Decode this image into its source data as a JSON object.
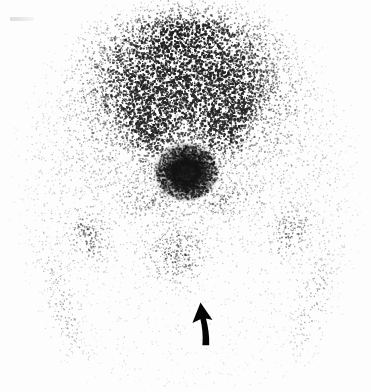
{
  "image": {
    "kind": "nuclear-medicine-scintigram",
    "modality_label": "Bone scintigraphy",
    "view_label": "Anterior pelvis",
    "width": 371,
    "height": 392,
    "background_color": "#fdfdfd",
    "noise_color": "#1a1a1a",
    "caption": ""
  },
  "annotations": {
    "arrow": {
      "name": "annotation-arrow",
      "label": "",
      "direction": "up",
      "color": "#050505",
      "tip_x": 201,
      "tip_y": 303,
      "tail_x": 208,
      "tail_y": 345
    },
    "corner_mark": {
      "name": "faint-corner-mark",
      "label": "",
      "x": 10,
      "y": 17
    }
  },
  "scan_data": {
    "type": "heatmap",
    "title": "",
    "xlabel": "",
    "ylabel": "",
    "colormap": "grayscale-inverted",
    "intensity_range": [
      0,
      1
    ],
    "grain": {
      "dots": 52000,
      "dot_size_min": 0.6,
      "dot_size_max": 1.9,
      "seed": 20240517
    },
    "field_of_view": {
      "shape": "rounded-rect",
      "cx": 186,
      "cy": 196,
      "rx": 172,
      "ry": 196
    },
    "regions": [
      {
        "name": "lumbosacral-spine-band",
        "label": "Lower lumbar spine / sacral base",
        "shape": "ellipse",
        "cx": 186,
        "cy": 30,
        "rx": 72,
        "ry": 42,
        "intensity": 0.92
      },
      {
        "name": "upper-sacrum",
        "label": "Upper sacrum",
        "shape": "ellipse",
        "cx": 184,
        "cy": 78,
        "rx": 58,
        "ry": 38,
        "intensity": 0.72
      },
      {
        "name": "sacrum-body",
        "label": "Sacrum",
        "shape": "ellipse",
        "cx": 184,
        "cy": 120,
        "rx": 46,
        "ry": 36,
        "intensity": 0.54
      },
      {
        "name": "left-iliac-wing",
        "label": "Left iliac wing",
        "shape": "ellipse",
        "cx": 124,
        "cy": 96,
        "rx": 42,
        "ry": 58,
        "intensity": 0.56,
        "rotation": -22
      },
      {
        "name": "right-iliac-wing",
        "label": "Right iliac wing",
        "shape": "ellipse",
        "cx": 248,
        "cy": 96,
        "rx": 42,
        "ry": 58,
        "intensity": 0.54,
        "rotation": 22
      },
      {
        "name": "left-sacroiliac-joint",
        "label": "Left sacroiliac joint",
        "shape": "ellipse",
        "cx": 146,
        "cy": 122,
        "rx": 20,
        "ry": 40,
        "intensity": 0.5,
        "rotation": -12
      },
      {
        "name": "right-sacroiliac-joint",
        "label": "Right sacroiliac joint",
        "shape": "ellipse",
        "cx": 226,
        "cy": 122,
        "rx": 20,
        "ry": 40,
        "intensity": 0.52,
        "rotation": 12
      },
      {
        "name": "focal-hot-spot",
        "label": "Focal intense uptake",
        "shape": "ellipse",
        "cx": 186,
        "cy": 172,
        "rx": 16,
        "ry": 14,
        "intensity": 1.0,
        "core": true
      },
      {
        "name": "hot-spot-halo",
        "label": "Perifocal halo",
        "shape": "ellipse",
        "cx": 186,
        "cy": 172,
        "rx": 34,
        "ry": 28,
        "intensity": 0.48
      },
      {
        "name": "left-superior-pubic-ramus",
        "label": "Left superior pubic ramus",
        "shape": "ellipse",
        "cx": 148,
        "cy": 200,
        "rx": 30,
        "ry": 16,
        "intensity": 0.32,
        "rotation": 16
      },
      {
        "name": "right-superior-pubic-ramus",
        "label": "Right superior pubic ramus",
        "shape": "ellipse",
        "cx": 226,
        "cy": 200,
        "rx": 30,
        "ry": 16,
        "intensity": 0.3,
        "rotation": -16
      },
      {
        "name": "bladder-pubic-symphysis",
        "label": "Bladder / pubic symphysis activity",
        "shape": "ellipse",
        "cx": 176,
        "cy": 256,
        "rx": 30,
        "ry": 30,
        "intensity": 0.46
      },
      {
        "name": "left-hip-femoral-head",
        "label": "Left femoral head / greater trochanter",
        "shape": "ellipse",
        "cx": 88,
        "cy": 236,
        "rx": 20,
        "ry": 26,
        "intensity": 0.42,
        "rotation": -28
      },
      {
        "name": "right-hip-femoral-head",
        "label": "Right femoral head / greater trochanter",
        "shape": "ellipse",
        "cx": 290,
        "cy": 232,
        "rx": 18,
        "ry": 26,
        "intensity": 0.4,
        "rotation": 28
      },
      {
        "name": "left-femoral-shaft",
        "label": "Left proximal femoral shaft",
        "shape": "ellipse",
        "cx": 62,
        "cy": 316,
        "rx": 17,
        "ry": 66,
        "intensity": 0.3,
        "rotation": -14
      },
      {
        "name": "right-femoral-shaft",
        "label": "Right proximal femoral shaft",
        "shape": "ellipse",
        "cx": 312,
        "cy": 312,
        "rx": 17,
        "ry": 66,
        "intensity": 0.3,
        "rotation": 14
      },
      {
        "name": "left-soft-tissue",
        "label": "Left pelvic soft tissue",
        "shape": "ellipse",
        "cx": 96,
        "cy": 160,
        "rx": 66,
        "ry": 96,
        "intensity": 0.17
      },
      {
        "name": "right-soft-tissue",
        "label": "Right pelvic soft tissue",
        "shape": "ellipse",
        "cx": 278,
        "cy": 160,
        "rx": 66,
        "ry": 96,
        "intensity": 0.17
      },
      {
        "name": "central-pelvic-cavity",
        "label": "Central pelvic cavity (photopenic)",
        "shape": "ellipse",
        "cx": 186,
        "cy": 222,
        "rx": 44,
        "ry": 40,
        "intensity": 0.08
      }
    ]
  }
}
